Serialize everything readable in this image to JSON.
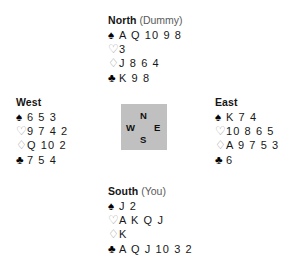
{
  "diagram": {
    "type": "bridge-deal",
    "suit_symbols": {
      "spade": "♠",
      "heart": "♡",
      "diamond": "♢",
      "club": "♣"
    },
    "compass": {
      "north": "N",
      "east": "E",
      "south": "S",
      "west": "W",
      "background_color": "#c0c0c0"
    },
    "hands": {
      "north": {
        "seat": "North",
        "role": "(Dummy)",
        "spades": "A Q 10 9 8",
        "hearts": "3",
        "diamonds": "J 8 6 4",
        "clubs": "K 9 8"
      },
      "west": {
        "seat": "West",
        "role": "",
        "spades": "6 5 3",
        "hearts": "9 7 4 2",
        "diamonds": "Q 10 2",
        "clubs": "7 5 4"
      },
      "east": {
        "seat": "East",
        "role": "",
        "spades": "K 7 4",
        "hearts": "10 8 6 5",
        "diamonds": "A 9 7 5 3",
        "clubs": "6"
      },
      "south": {
        "seat": "South",
        "role": "(You)",
        "spades": "J 2",
        "hearts": "A K Q J",
        "diamonds": "K",
        "clubs": "A Q J 10 3 2"
      }
    }
  }
}
